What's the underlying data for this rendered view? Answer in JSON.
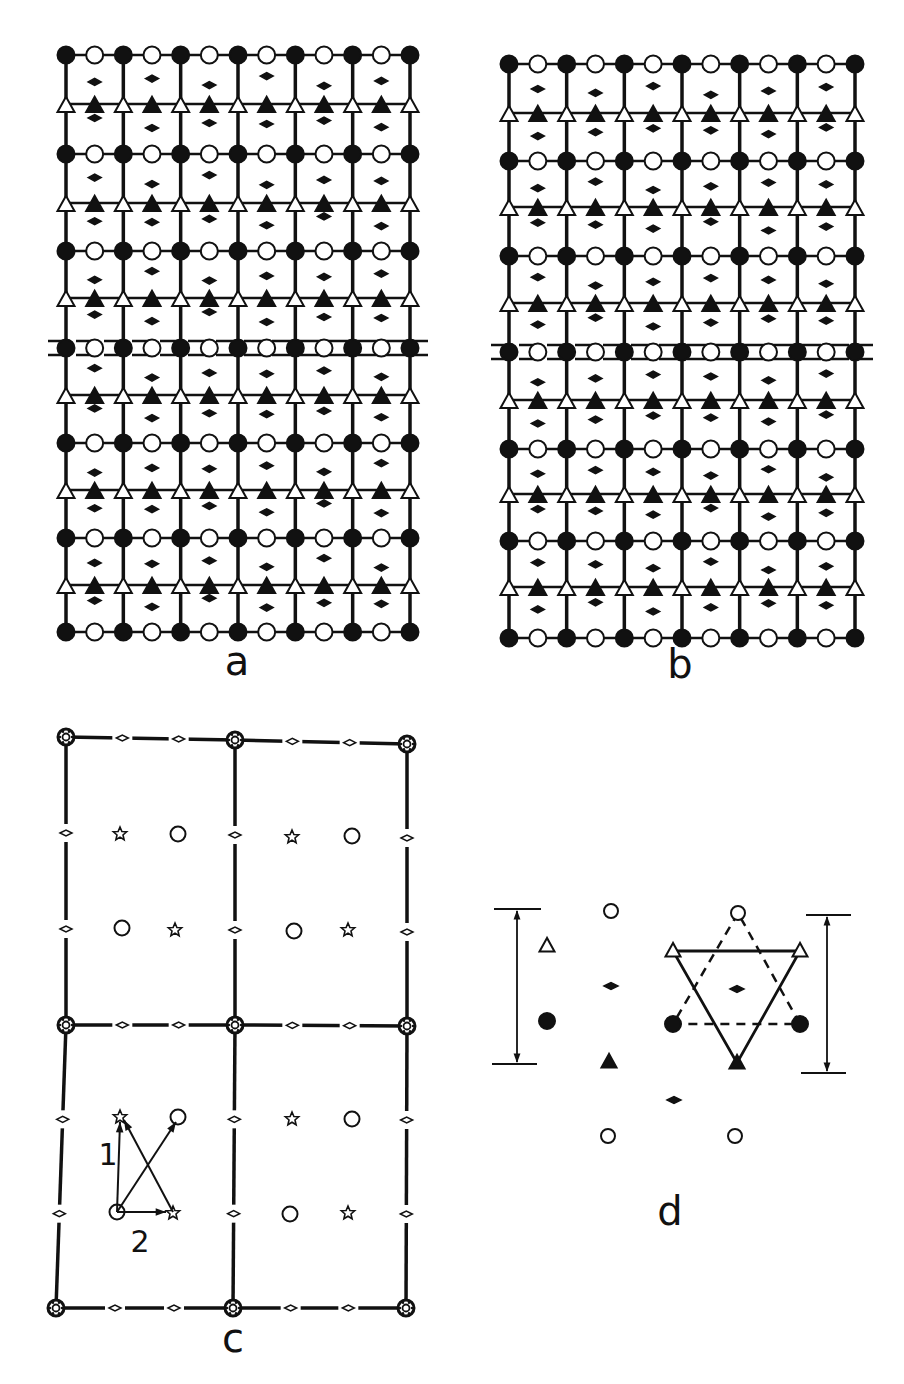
{
  "figure": {
    "colors": {
      "ink": "#111111",
      "paper": "#ffffff"
    },
    "panels": {
      "a": {
        "label": "a",
        "label_pos": [
          237,
          675
        ],
        "x0": 66,
        "x1": 410,
        "columns": 6,
        "circle_rows_y": [
          55,
          154,
          251,
          348,
          443,
          538,
          632
        ],
        "triangle_rows_y": [
          104,
          203,
          298,
          395,
          490,
          585
        ],
        "dashed_row_index": 3,
        "diamond_pattern": [
          [
            1,
            0.5
          ],
          [
            2,
            0.33
          ],
          [
            3,
            0.66
          ],
          [
            4,
            0.2
          ],
          [
            5,
            0.7
          ],
          [
            6,
            0.45
          ]
        ]
      },
      "b": {
        "label": "b",
        "label_pos": [
          680,
          678
        ],
        "x0": 509,
        "x1": 855,
        "columns": 6,
        "circle_rows_y": [
          64,
          161,
          256,
          352,
          449,
          541,
          638
        ],
        "triangle_rows_y": [
          113,
          207,
          303,
          400,
          494,
          587
        ],
        "dashed_row_index": 3,
        "diamond_pattern": [
          [
            1,
            0.4
          ],
          [
            2,
            0.6
          ],
          [
            3,
            0.25
          ],
          [
            4,
            0.7
          ],
          [
            5,
            0.5
          ],
          [
            6,
            0.3
          ]
        ]
      },
      "c": {
        "label": "c",
        "label_pos": [
          233,
          1352
        ],
        "frame_cols_x": [
          [
            66,
            235,
            407
          ],
          [
            66,
            235,
            407
          ],
          [
            56,
            233,
            406
          ]
        ],
        "frame_rows_y": [
          [
            737,
            740,
            744
          ],
          [
            1025,
            1025,
            1026
          ],
          [
            1308,
            1308,
            1308
          ]
        ],
        "stars": [
          [
            120,
            834
          ],
          [
            292,
            837
          ],
          [
            175,
            930
          ],
          [
            348,
            930
          ],
          [
            120,
            1117
          ],
          [
            292,
            1119
          ],
          [
            173,
            1213
          ],
          [
            348,
            1213
          ]
        ],
        "circles": [
          [
            178,
            834
          ],
          [
            352,
            836
          ],
          [
            122,
            928
          ],
          [
            294,
            931
          ],
          [
            178,
            1117
          ],
          [
            352,
            1119
          ],
          [
            117,
            1212
          ],
          [
            290,
            1214
          ]
        ],
        "vectors": [
          {
            "from": [
              117,
              1212
            ],
            "to": [
              120,
              1122
            ]
          },
          {
            "from": [
              117,
              1212
            ],
            "to": [
              176,
              1122
            ]
          },
          {
            "from": [
              117,
              1212
            ],
            "to": [
              166,
              1212
            ]
          },
          {
            "from": [
              173,
              1212
            ],
            "to": [
              124,
              1120
            ]
          }
        ],
        "vector_labels": [
          {
            "text": "1",
            "pos": [
              108,
              1165
            ]
          },
          {
            "text": "2",
            "pos": [
              140,
              1252
            ]
          }
        ]
      },
      "d": {
        "label": "d",
        "label_pos": [
          670,
          1225
        ],
        "left_bracket": {
          "x": 517,
          "top": 909,
          "bottom": 1064,
          "top_line": [
            494,
            541
          ],
          "bottom_line": [
            492,
            537
          ]
        },
        "right_bracket": {
          "x": 827,
          "top": 915,
          "bottom": 1073,
          "top_line": [
            806,
            851
          ],
          "bottom_line": [
            801,
            846
          ]
        },
        "open_circles": [
          [
            611,
            911
          ],
          [
            738,
            913
          ],
          [
            608,
            1136
          ],
          [
            735,
            1136
          ]
        ],
        "filled_circles": [
          [
            547,
            1021
          ],
          [
            673,
            1024
          ],
          [
            800,
            1024
          ]
        ],
        "open_triangles": [
          [
            547,
            946
          ],
          [
            673,
            951
          ],
          [
            800,
            951
          ]
        ],
        "filled_triangles": [
          [
            609,
            1062
          ],
          [
            737,
            1063
          ]
        ],
        "diamonds": [
          [
            611,
            986
          ],
          [
            737,
            989
          ],
          [
            674,
            1100
          ]
        ],
        "solid_triangle": [
          [
            673,
            951
          ],
          [
            800,
            951
          ],
          [
            737,
            1063
          ]
        ],
        "dashed_triangle": [
          [
            738,
            913
          ],
          [
            673,
            1024
          ],
          [
            800,
            1024
          ]
        ]
      }
    }
  }
}
